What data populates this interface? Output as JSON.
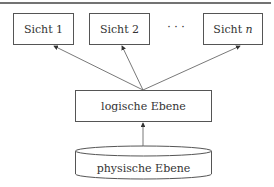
{
  "diagram": {
    "views": [
      {
        "label": "Sicht 1"
      },
      {
        "label": "Sicht 2"
      },
      {
        "label": "Sicht ",
        "suffix": "n"
      }
    ],
    "ellipsis": "· · ·",
    "logical_layer": {
      "label": "logische Ebene"
    },
    "physical_layer": {
      "label": "physische Ebene",
      "shape": "cylinder"
    },
    "colors": {
      "stroke": "#555555",
      "text": "#333333",
      "rule": "#444444"
    }
  }
}
